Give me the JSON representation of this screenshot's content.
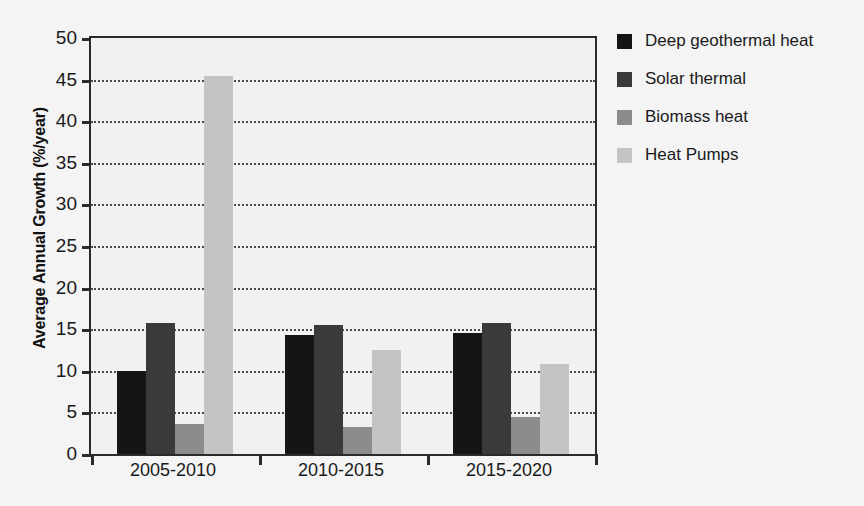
{
  "chart_data": {
    "type": "bar",
    "title": "",
    "xlabel": "",
    "ylabel": "Average Annual Growth (%/year)",
    "categories": [
      "2005-2010",
      "2010-2015",
      "2015-2020"
    ],
    "series": [
      {
        "name": "Deep geothermal heat",
        "color": "#151515",
        "values": [
          10.0,
          14.3,
          14.6
        ]
      },
      {
        "name": "Solar thermal",
        "color": "#3a3a3a",
        "values": [
          15.7,
          15.5,
          15.8
        ]
      },
      {
        "name": "Biomass heat",
        "color": "#8c8c8c",
        "values": [
          3.6,
          3.2,
          4.4
        ]
      },
      {
        "name": "Heat Pumps",
        "color": "#c4c4c4",
        "values": [
          45.4,
          12.5,
          10.8
        ]
      }
    ],
    "ylim": [
      0,
      50
    ],
    "yticks": [
      0,
      5,
      10,
      15,
      20,
      25,
      30,
      35,
      40,
      45,
      50
    ],
    "ytick_labels": [
      "0",
      "5",
      "10",
      "15",
      "20",
      "25",
      "30",
      "35",
      "40",
      "45",
      "50"
    ],
    "grid": true,
    "grid_style": "dotted",
    "legend_position": "right",
    "plot_background": "#f1f1f1",
    "figure_background": "#f4f4f4",
    "axis_color": "#2b2b2b"
  }
}
